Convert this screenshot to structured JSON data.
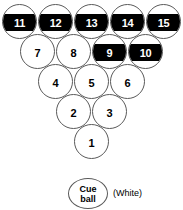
{
  "diagram": {
    "ball_diameter_px": 35,
    "colors": {
      "ball_fill": "#ffffff",
      "ball_outline": "#5a5a5a",
      "stripe_band": "#000000",
      "solid_number": "#000000",
      "stripe_number": "#ffffff"
    }
  },
  "rack": {
    "rows": [
      {
        "row": 1,
        "balls": [
          {
            "number": "11",
            "type": "stripe"
          },
          {
            "number": "12",
            "type": "stripe"
          },
          {
            "number": "13",
            "type": "stripe"
          },
          {
            "number": "14",
            "type": "stripe"
          },
          {
            "number": "15",
            "type": "stripe"
          }
        ]
      },
      {
        "row": 2,
        "balls": [
          {
            "number": "7",
            "type": "solid"
          },
          {
            "number": "8",
            "type": "solid"
          },
          {
            "number": "9",
            "type": "stripe"
          },
          {
            "number": "10",
            "type": "stripe"
          }
        ]
      },
      {
        "row": 3,
        "balls": [
          {
            "number": "4",
            "type": "solid"
          },
          {
            "number": "5",
            "type": "solid"
          },
          {
            "number": "6",
            "type": "solid"
          }
        ]
      },
      {
        "row": 4,
        "balls": [
          {
            "number": "2",
            "type": "solid"
          },
          {
            "number": "3",
            "type": "solid"
          }
        ]
      },
      {
        "row": 5,
        "balls": [
          {
            "number": "1",
            "type": "solid"
          }
        ]
      }
    ]
  },
  "cue_ball": {
    "line1": "Cue",
    "line2": "ball",
    "color_label": "(White)"
  },
  "legend": {
    "groups": [
      {
        "lines": [
          "Stripe",
          "Stripe"
        ]
      },
      {
        "lines": [
          "Stripe",
          "Stripe",
          "Stripe"
        ]
      }
    ]
  }
}
